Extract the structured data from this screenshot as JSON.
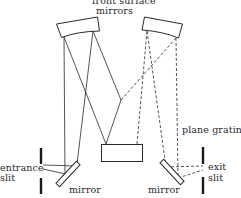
{
  "diagram": {
    "type": "optical-schematic",
    "labels": {
      "top_line1": "front surface",
      "top_line2": "mirrors",
      "plane_grating": "plane grating",
      "entrance_line1": "entrance",
      "entrance_line2": "slit",
      "exit_line1": "exit",
      "exit_line2": "slit",
      "mirror_left": "mirror",
      "mirror_right": "mirror"
    },
    "components": [
      {
        "id": "left-front-surface-mirror",
        "kind": "concave mirror"
      },
      {
        "id": "right-front-surface-mirror",
        "kind": "concave mirror"
      },
      {
        "id": "plane-grating",
        "kind": "grating"
      },
      {
        "id": "left-flat-mirror",
        "kind": "plane mirror"
      },
      {
        "id": "right-flat-mirror",
        "kind": "plane mirror"
      },
      {
        "id": "entrance-slit",
        "kind": "slit"
      },
      {
        "id": "exit-slit",
        "kind": "slit"
      }
    ],
    "ray_styles": {
      "incoming": "solid",
      "outgoing": "dashed"
    },
    "colors": {
      "stroke": "#2a2a2a",
      "background": "#ffffff"
    }
  }
}
